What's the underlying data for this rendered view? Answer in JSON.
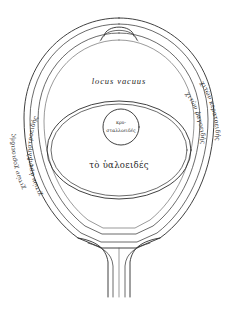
{
  "figure": {
    "background_color": "#ffffff",
    "ink_color": "#2b2b2b"
  },
  "labels": {
    "upper_chamber": "locus vacuus",
    "vitreous_body": "τὸ ὑαλοειδές",
    "lens_line1": "κρυ-",
    "lens_line2": "σταλλοειδές"
  },
  "tunics": {
    "left_outer": "χιτὼν χοριοειδής",
    "left_inner": "χιτὼν ἀμφιβληστροειδής",
    "right_outer": "χιτὼν κερατοειδής",
    "right_inner": "χιτὼν ῥαγοειδής"
  },
  "parts": {
    "cornea_bulge": "corneal apex",
    "optic_nerve": "optic nerve stalk",
    "outer_sclera": "outer sclera contour",
    "inner_oval": "vitreous boundary oval",
    "lens_circle": "crystalline lens circle"
  }
}
